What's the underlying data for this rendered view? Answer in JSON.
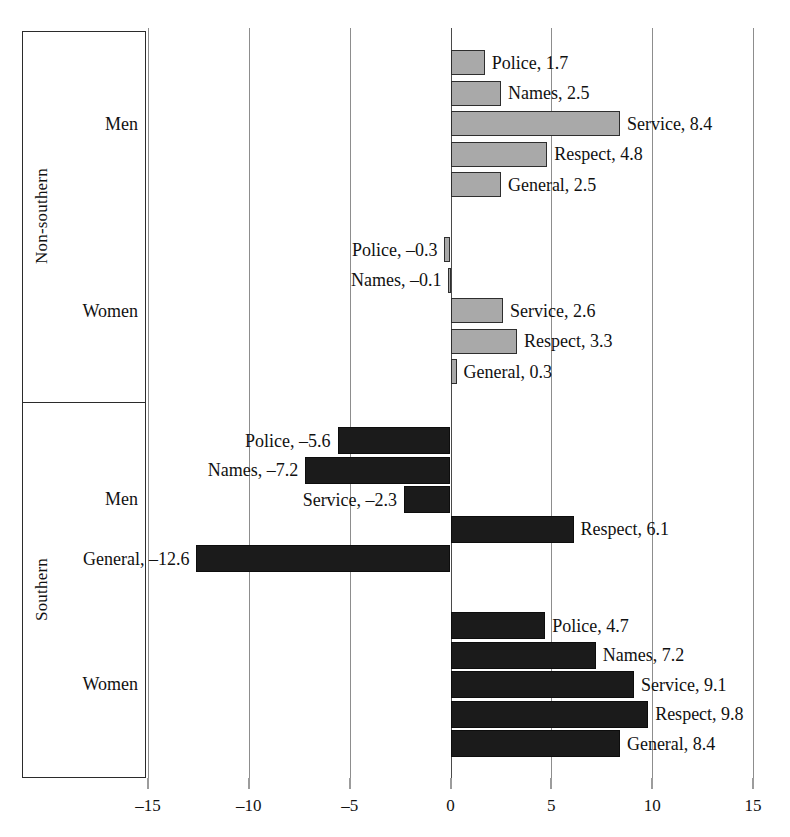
{
  "chart_data": {
    "type": "bar",
    "orientation": "horizontal",
    "title": "",
    "subtitle": "",
    "xlabel": "",
    "ylabel": "",
    "xlim": [
      -15,
      15
    ],
    "xticks": [
      -15,
      -10,
      -5,
      0,
      5,
      10,
      15
    ],
    "xticklabels": [
      "–15",
      "–10",
      "–5",
      "0",
      "5",
      "10",
      "15"
    ],
    "grid": true,
    "legend": "none",
    "categories": [
      "Police",
      "Names",
      "Service",
      "Respect",
      "General"
    ],
    "colors": {
      "non_southern": "#a9a9a9",
      "southern": "#1b1b1b",
      "gridline": "#8d8d8d",
      "zero_line": "#4a4a4a",
      "axis_frame": "#2b2b2b"
    },
    "groups": [
      {
        "region": "Non-southern",
        "subgroups": [
          {
            "sex": "Men",
            "color_key": "non_southern",
            "bars": [
              {
                "category": "Police",
                "value": 1.7,
                "label": "Police, 1.7"
              },
              {
                "category": "Names",
                "value": 2.5,
                "label": "Names, 2.5"
              },
              {
                "category": "Service",
                "value": 8.4,
                "label": "Service, 8.4"
              },
              {
                "category": "Respect",
                "value": 4.8,
                "label": "Respect, 4.8"
              },
              {
                "category": "General",
                "value": 2.5,
                "label": "General, 2.5"
              }
            ]
          },
          {
            "sex": "Women",
            "color_key": "non_southern",
            "bars": [
              {
                "category": "Police",
                "value": -0.3,
                "label": "Police, –0.3"
              },
              {
                "category": "Names",
                "value": -0.1,
                "label": "Names, –0.1"
              },
              {
                "category": "Service",
                "value": 2.6,
                "label": "Service, 2.6"
              },
              {
                "category": "Respect",
                "value": 3.3,
                "label": "Respect, 3.3"
              },
              {
                "category": "General",
                "value": 0.3,
                "label": "General, 0.3"
              }
            ]
          }
        ]
      },
      {
        "region": "Southern",
        "subgroups": [
          {
            "sex": "Men",
            "color_key": "southern",
            "bars": [
              {
                "category": "Police",
                "value": -5.6,
                "label": "Police, –5.6"
              },
              {
                "category": "Names",
                "value": -7.2,
                "label": "Names, –7.2"
              },
              {
                "category": "Service",
                "value": -2.3,
                "label": "Service, –2.3"
              },
              {
                "category": "Respect",
                "value": 6.1,
                "label": "Respect, 6.1"
              },
              {
                "category": "General",
                "value": -12.6,
                "label": "General, –12.6"
              }
            ]
          },
          {
            "sex": "Women",
            "color_key": "southern",
            "bars": [
              {
                "category": "Police",
                "value": 4.7,
                "label": "Police, 4.7"
              },
              {
                "category": "Names",
                "value": 7.2,
                "label": "Names, 7.2"
              },
              {
                "category": "Service",
                "value": 9.1,
                "label": "Service, 9.1"
              },
              {
                "category": "Respect",
                "value": 9.8,
                "label": "Respect, 9.8"
              },
              {
                "category": "General",
                "value": 8.4,
                "label": "General, 8.4"
              }
            ]
          }
        ]
      }
    ]
  },
  "axis": {
    "region_labels": [
      "Non-southern",
      "Southern"
    ],
    "sex_labels": [
      "Men",
      "Women",
      "Men",
      "Women"
    ]
  }
}
